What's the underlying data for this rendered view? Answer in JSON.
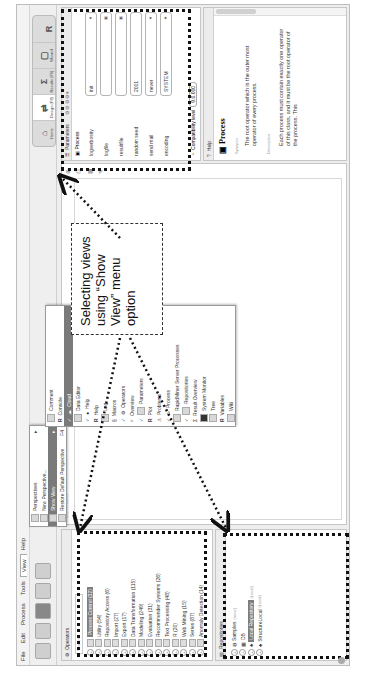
{
  "menubar": [
    "File",
    "Edit",
    "Process",
    "Tools",
    "View",
    "Help"
  ],
  "view_menu": {
    "items": [
      {
        "label": "Perspectives",
        "has_submenu": true
      },
      {
        "label": "New Perspective..."
      },
      {
        "label": "Show View",
        "selected": true,
        "has_submenu": true
      },
      {
        "label": "Restore Default Perspective"
      }
    ],
    "shortcut": "F4"
  },
  "show_view_submenu": [
    {
      "label": "Comment",
      "icon": "comment-icon"
    },
    {
      "label": "Console",
      "icon": "r-icon"
    },
    {
      "label": "Cloud",
      "icon": "cloud-icon",
      "selected": true,
      "checked": true
    },
    {
      "label": "Data Editor",
      "icon": "table-icon"
    },
    {
      "label": "Help",
      "icon": "help-icon",
      "checked": true
    },
    {
      "label": "Help",
      "icon": "r-icon"
    },
    {
      "label": "Log",
      "icon": "log-icon"
    },
    {
      "label": "Macros",
      "icon": "macro-icon"
    },
    {
      "label": "Operators",
      "icon": "operator-icon",
      "checked": true
    },
    {
      "label": "Overview",
      "icon": "magnifier-icon"
    },
    {
      "label": "Parameters",
      "icon": "parameters-icon",
      "checked": true
    },
    {
      "label": "Plot",
      "icon": "r-icon"
    },
    {
      "label": "Problems",
      "icon": "warning-icon"
    },
    {
      "label": "Process",
      "icon": "process-icon",
      "checked": true
    },
    {
      "label": "RapidMiner Server Processes",
      "icon": "server-icon"
    },
    {
      "label": "Repositories",
      "icon": "repository-icon",
      "checked": true
    },
    {
      "label": "Result Overview",
      "icon": "chart-icon"
    },
    {
      "label": "System Monitor",
      "icon": "monitor-icon"
    },
    {
      "label": "Tree",
      "icon": "tree-icon"
    },
    {
      "label": "Variables",
      "icon": "r-icon"
    },
    {
      "label": "Wiki",
      "icon": "wiki-icon"
    }
  ],
  "perspectives": [
    {
      "label": "Home",
      "glyph": "⌂"
    },
    {
      "label": "Design (F8)",
      "glyph": "⇄",
      "selected": true
    },
    {
      "label": "Results (F9)",
      "glyph": "Σ"
    },
    {
      "label": "Wizard",
      "glyph": "▢"
    },
    {
      "label": "",
      "glyph": "R"
    }
  ],
  "operators_panel": {
    "title": "Operators",
    "search_placeholder": "Search",
    "items": [
      {
        "label": "Process Control (32)",
        "selected": true
      },
      {
        "label": "Utility (54)"
      },
      {
        "label": "Repository Access (6)"
      },
      {
        "label": "Import (27)"
      },
      {
        "label": "Export (17)"
      },
      {
        "label": "Data Transformation (115)"
      },
      {
        "label": "Modeling (249)"
      },
      {
        "label": "Evaluation (31)"
      },
      {
        "label": "Recommender Systems (26)"
      },
      {
        "label": "Text Processing (48)"
      },
      {
        "label": "R (20)"
      },
      {
        "label": "Web Mining (15)"
      },
      {
        "label": "Series (87)"
      },
      {
        "label": "Anomaly Detection (14)"
      }
    ]
  },
  "repositories_panel": {
    "title": "Repositories",
    "items": [
      {
        "label": "Samples",
        "suffix": "(none)"
      },
      {
        "label": "DB"
      },
      {
        "label": "Local Repository",
        "suffix": "(Local)",
        "selected": true
      },
      {
        "label": "StructureLocal",
        "suffix": "(Local)"
      }
    ]
  },
  "process_panel": {
    "title": "Main Process"
  },
  "parameters_panel": {
    "title": "Parameters",
    "operator": "Process",
    "rows": [
      {
        "label": "logverbosity",
        "value": "init",
        "type": "select"
      },
      {
        "label": "logfile",
        "value": "",
        "type": "file"
      },
      {
        "label": "resultfile",
        "value": "",
        "type": "file"
      },
      {
        "label": "random seed",
        "value": "2001",
        "type": "text"
      },
      {
        "label": "send mail",
        "value": "never",
        "type": "select"
      },
      {
        "label": "encoding",
        "value": "SYSTEM",
        "type": "select"
      }
    ],
    "compat_label": "Compatibility level",
    "compat_value": "9.0.000"
  },
  "help_panel": {
    "title": "Help",
    "operator": "Process",
    "synopsis_label": "Synopsis",
    "synopsis": "The root operator which is the outer most operator of every process.",
    "description_label": "Description",
    "description": "Each process must contain exactly one operator of this class, and it must be the root operator of the process. This"
  },
  "callout": {
    "text": "Selecting views using “Show View” menu option"
  }
}
